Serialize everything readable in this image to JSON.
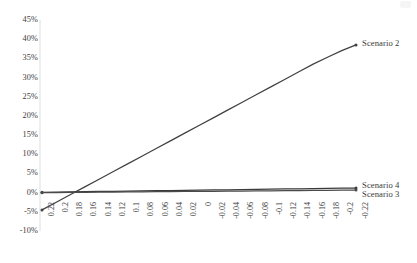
{
  "chart_data": {
    "type": "line",
    "title": "",
    "xlabel": "",
    "ylabel": "",
    "grid": false,
    "legend_position": "right-inline",
    "ylim": [
      -10,
      45
    ],
    "ytick_labels": [
      "45%",
      "40%",
      "35%",
      "30%",
      "25%",
      "20%",
      "15%",
      "10%",
      "5%",
      "0%",
      "-5%",
      "-10%"
    ],
    "ytick_values": [
      45,
      40,
      35,
      30,
      25,
      20,
      15,
      10,
      5,
      0,
      -5,
      -10
    ],
    "x": [
      0.22,
      0.2,
      0.18,
      0.16,
      0.14,
      0.12,
      0.1,
      0.08,
      0.06,
      0.04,
      0.02,
      0,
      -0.02,
      -0.04,
      -0.06,
      -0.08,
      -0.1,
      -0.12,
      -0.14,
      -0.16,
      -0.18,
      -0.2,
      -0.22
    ],
    "xtick_labels": [
      "0.22",
      "0.2",
      "0.18",
      "0.16",
      "0.14",
      "0.12",
      "0.1",
      "0.08",
      "0.06",
      "0.04",
      "0.02",
      "0",
      "-0.02",
      "-0.04",
      "-0.06",
      "-0.08",
      "-0.1",
      "-0.12",
      "-0.14",
      "-0.16",
      "-0.18",
      "-0.2",
      "-0.22"
    ],
    "series": [
      {
        "name": "Scenario 2",
        "color": "#404040",
        "values": [
          -4.5,
          -2.5,
          -0.5,
          1.5,
          3.5,
          5.5,
          7.5,
          9.5,
          11.5,
          13.5,
          15.5,
          17.5,
          19.5,
          21.5,
          23.5,
          25.5,
          27.5,
          29.5,
          31.5,
          33.5,
          35.3,
          37.0,
          38.5
        ]
      },
      {
        "name": "Scenario 4",
        "color": "#3a3a3a",
        "values": [
          0.1,
          0.15,
          0.2,
          0.25,
          0.3,
          0.35,
          0.4,
          0.45,
          0.5,
          0.55,
          0.6,
          0.65,
          0.7,
          0.75,
          0.8,
          0.85,
          0.9,
          0.95,
          1.0,
          1.05,
          1.1,
          1.15,
          1.2
        ]
      },
      {
        "name": "Scenario 3",
        "color": "#4a4a4a",
        "values": [
          0.0,
          0.03,
          0.06,
          0.09,
          0.12,
          0.15,
          0.18,
          0.21,
          0.24,
          0.27,
          0.3,
          0.33,
          0.36,
          0.39,
          0.42,
          0.45,
          0.48,
          0.51,
          0.54,
          0.57,
          0.6,
          0.63,
          0.66
        ]
      }
    ]
  },
  "labels": {
    "scenario2": "Scenario 2",
    "scenario3": "Scenario 3",
    "scenario4": "Scenario 4"
  },
  "colors": {
    "axis": "#e3e3e3",
    "line": "#3f3f3f",
    "text": "#3a3a3a",
    "background": "#ffffff"
  }
}
